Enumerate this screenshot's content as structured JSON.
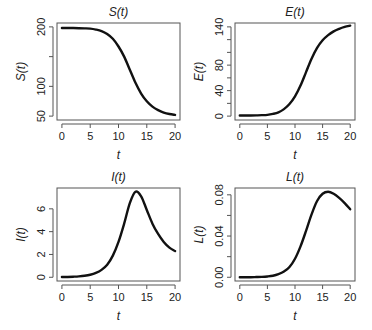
{
  "chart_data": [
    {
      "type": "line",
      "title": "S(t)",
      "xlabel": "t",
      "ylabel": "S(t)",
      "xlim": [
        0,
        20
      ],
      "ylim": [
        50,
        200
      ],
      "xticks": [
        0,
        5,
        10,
        15,
        20
      ],
      "yticks": [
        50,
        100,
        150,
        200
      ],
      "ytick_labels": [
        "50",
        "100",
        "",
        "200"
      ],
      "grid": false,
      "x": [
        0,
        1,
        2,
        3,
        4,
        5,
        6,
        7,
        8,
        9,
        10,
        11,
        12,
        13,
        14,
        15,
        16,
        17,
        18,
        19,
        20
      ],
      "series": [
        {
          "name": "S(t)",
          "values": [
            198,
            198,
            198,
            197.8,
            197.5,
            197,
            195.5,
            193,
            188,
            180,
            167,
            150,
            128,
            106,
            88,
            75,
            66,
            60,
            56,
            53.5,
            52
          ]
        }
      ]
    },
    {
      "type": "line",
      "title": "E(t)",
      "xlabel": "t",
      "ylabel": "E(t)",
      "xlim": [
        0,
        20
      ],
      "ylim": [
        0,
        140
      ],
      "xticks": [
        0,
        5,
        10,
        15,
        20
      ],
      "yticks": [
        0,
        20,
        40,
        60,
        80,
        100,
        120,
        140
      ],
      "ytick_labels": [
        "0",
        "",
        "40",
        "",
        "80",
        "",
        "",
        "140"
      ],
      "grid": false,
      "x": [
        0,
        1,
        2,
        3,
        4,
        5,
        6,
        7,
        8,
        9,
        10,
        11,
        12,
        13,
        14,
        15,
        16,
        17,
        18,
        19,
        20
      ],
      "series": [
        {
          "name": "E(t)",
          "values": [
            1,
            1,
            1,
            1.2,
            1.5,
            2,
            3.5,
            6,
            11,
            19,
            31,
            48,
            69,
            90,
            107,
            119,
            127,
            133,
            137,
            140,
            142
          ]
        }
      ]
    },
    {
      "type": "line",
      "title": "I(t)",
      "xlabel": "t",
      "ylabel": "I(t)",
      "xlim": [
        0,
        20
      ],
      "ylim": [
        0,
        7.5
      ],
      "xticks": [
        0,
        5,
        10,
        15,
        20
      ],
      "yticks": [
        0,
        2,
        4,
        6
      ],
      "ytick_labels": [
        "0",
        "2",
        "4",
        "6"
      ],
      "grid": false,
      "x": [
        0,
        1,
        2,
        3,
        4,
        5,
        6,
        7,
        8,
        9,
        10,
        11,
        12,
        13,
        14,
        15,
        16,
        17,
        18,
        19,
        20
      ],
      "series": [
        {
          "name": "I(t)",
          "values": [
            0.02,
            0.03,
            0.05,
            0.08,
            0.13,
            0.22,
            0.38,
            0.65,
            1.1,
            1.9,
            3.1,
            4.7,
            6.5,
            7.5,
            7.1,
            5.9,
            4.7,
            3.8,
            3.1,
            2.6,
            2.3
          ]
        }
      ]
    },
    {
      "type": "line",
      "title": "L(t)",
      "xlabel": "t",
      "ylabel": "L(t)",
      "xlim": [
        0,
        20
      ],
      "ylim": [
        0,
        0.083
      ],
      "xticks": [
        0,
        5,
        10,
        15,
        20
      ],
      "yticks": [
        0,
        0.02,
        0.04,
        0.06,
        0.08
      ],
      "ytick_labels": [
        "0.00",
        "",
        "0.04",
        "",
        "0.08"
      ],
      "grid": false,
      "x": [
        0,
        1,
        2,
        3,
        4,
        5,
        6,
        7,
        8,
        9,
        10,
        11,
        12,
        13,
        14,
        15,
        16,
        17,
        18,
        19,
        20
      ],
      "series": [
        {
          "name": "L(t)",
          "values": [
            0.0,
            0.0,
            0.0,
            0.0002,
            0.0004,
            0.0008,
            0.0015,
            0.003,
            0.0055,
            0.01,
            0.018,
            0.03,
            0.045,
            0.061,
            0.074,
            0.081,
            0.083,
            0.081,
            0.077,
            0.072,
            0.066
          ]
        }
      ]
    }
  ]
}
